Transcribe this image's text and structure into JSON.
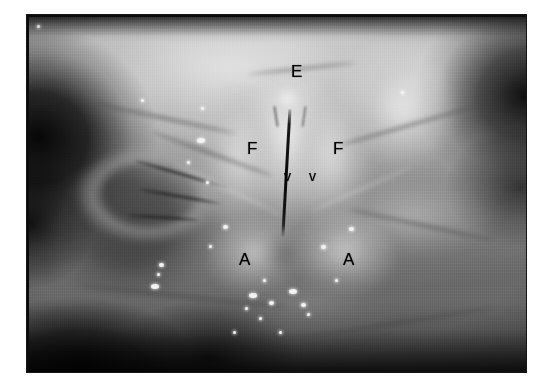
{
  "figure": {
    "kind": "endoscopic-photograph",
    "modality": "laryngoscopy",
    "color_mode": "grayscale",
    "frame_color": "#0b0b0b",
    "page_background": "#ffffff"
  },
  "annotations": {
    "labels": [
      {
        "id": "epiglottis",
        "text": "E",
        "case": "cap",
        "x": 290,
        "y": 62
      },
      {
        "id": "false-fold-left",
        "text": "F",
        "case": "cap",
        "x": 246,
        "y": 139
      },
      {
        "id": "false-fold-right",
        "text": "F",
        "case": "cap",
        "x": 332,
        "y": 139
      },
      {
        "id": "vocal-fold-left",
        "text": "v",
        "case": "low",
        "x": 283,
        "y": 168
      },
      {
        "id": "vocal-fold-right",
        "text": "v",
        "case": "low",
        "x": 308,
        "y": 168
      },
      {
        "id": "arytenoid-left",
        "text": "A",
        "case": "cap",
        "x": 238,
        "y": 250
      },
      {
        "id": "arytenoid-right",
        "text": "A",
        "case": "cap",
        "x": 342,
        "y": 250
      }
    ],
    "legend_meaning": {
      "E": "epiglottis",
      "F": "false vocal fold",
      "v": "true vocal fold",
      "A": "arytenoid"
    }
  },
  "specular_highlights": [
    {
      "x": 16,
      "y": 26,
      "size": "sm"
    },
    {
      "x": 36,
      "y": 24,
      "size": "sm"
    },
    {
      "x": 140,
      "y": 98,
      "size": "sm"
    },
    {
      "x": 200,
      "y": 106,
      "size": "sm"
    },
    {
      "x": 196,
      "y": 137,
      "size": "lg"
    },
    {
      "x": 186,
      "y": 160,
      "size": "sm"
    },
    {
      "x": 205,
      "y": 180,
      "size": "sm"
    },
    {
      "x": 222,
      "y": 224,
      "size": "md"
    },
    {
      "x": 208,
      "y": 244,
      "size": "sm"
    },
    {
      "x": 158,
      "y": 262,
      "size": "md"
    },
    {
      "x": 150,
      "y": 283,
      "size": "lg"
    },
    {
      "x": 156,
      "y": 272,
      "size": "sm"
    },
    {
      "x": 248,
      "y": 292,
      "size": "lg"
    },
    {
      "x": 268,
      "y": 300,
      "size": "md"
    },
    {
      "x": 258,
      "y": 316,
      "size": "sm"
    },
    {
      "x": 288,
      "y": 288,
      "size": "lg"
    },
    {
      "x": 300,
      "y": 302,
      "size": "md"
    },
    {
      "x": 306,
      "y": 312,
      "size": "sm"
    },
    {
      "x": 278,
      "y": 330,
      "size": "sm"
    },
    {
      "x": 320,
      "y": 244,
      "size": "md"
    },
    {
      "x": 348,
      "y": 226,
      "size": "md"
    },
    {
      "x": 262,
      "y": 278,
      "size": "sm"
    },
    {
      "x": 232,
      "y": 330,
      "size": "sm"
    },
    {
      "x": 244,
      "y": 306,
      "size": "sm"
    },
    {
      "x": 334,
      "y": 278,
      "size": "sm"
    },
    {
      "x": 400,
      "y": 90,
      "size": "sm"
    }
  ]
}
